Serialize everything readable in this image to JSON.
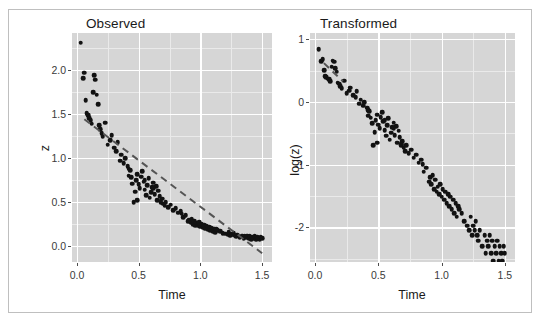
{
  "figure": {
    "width": 541,
    "height": 320,
    "background": "#ffffff",
    "border_color": "#bfbfbf",
    "panel_fill": "#d6d6d6",
    "grid_major_color": "#ffffff",
    "grid_minor_color": "#eaeaea",
    "point_color": "#121212",
    "fitline_color": "#555555"
  },
  "chart_data": [
    {
      "type": "scatter",
      "title": "Observed",
      "xlabel": "Time",
      "ylabel": "z",
      "xlim": [
        -0.04,
        1.58
      ],
      "ylim": [
        -0.18,
        2.42
      ],
      "xticks": [
        0.0,
        0.5,
        1.0,
        1.5
      ],
      "xticklabels": [
        "0.0",
        "0.5",
        "1.0",
        "1.5"
      ],
      "yticks": [
        0.0,
        0.5,
        1.0,
        1.5,
        2.0
      ],
      "yticklabels": [
        "0.0",
        "0.5",
        "1.0",
        "1.5",
        "2.0"
      ],
      "xminor": [
        0.25,
        0.75,
        1.25
      ],
      "yminor": [
        0.25,
        0.75,
        1.25,
        1.75,
        2.25
      ],
      "grid": true,
      "legend": "none",
      "fit_line": {
        "style": "dashed",
        "x": [
          0.06,
          1.5
        ],
        "y": [
          1.44,
          -0.08
        ]
      },
      "x": [
        0.03,
        0.05,
        0.06,
        0.07,
        0.08,
        0.09,
        0.1,
        0.11,
        0.12,
        0.13,
        0.14,
        0.15,
        0.16,
        0.17,
        0.18,
        0.19,
        0.2,
        0.21,
        0.23,
        0.25,
        0.27,
        0.28,
        0.3,
        0.32,
        0.33,
        0.35,
        0.36,
        0.38,
        0.39,
        0.41,
        0.42,
        0.43,
        0.44,
        0.45,
        0.46,
        0.47,
        0.48,
        0.49,
        0.5,
        0.51,
        0.52,
        0.53,
        0.54,
        0.55,
        0.56,
        0.57,
        0.58,
        0.59,
        0.6,
        0.61,
        0.62,
        0.63,
        0.64,
        0.65,
        0.66,
        0.67,
        0.68,
        0.69,
        0.7,
        0.71,
        0.72,
        0.74,
        0.76,
        0.78,
        0.8,
        0.82,
        0.84,
        0.86,
        0.88,
        0.9,
        0.91,
        0.92,
        0.93,
        0.94,
        0.95,
        0.96,
        0.97,
        0.98,
        0.99,
        1.0,
        1.01,
        1.02,
        1.03,
        1.04,
        1.05,
        1.06,
        1.07,
        1.08,
        1.09,
        1.1,
        1.11,
        1.12,
        1.14,
        1.16,
        1.18,
        1.2,
        1.22,
        1.23,
        1.24,
        1.25,
        1.26,
        1.27,
        1.28,
        1.29,
        1.3,
        1.32,
        1.34,
        1.35,
        1.36,
        1.37,
        1.38,
        1.39,
        1.4,
        1.41,
        1.42,
        1.43,
        1.44,
        1.45,
        1.46,
        1.47,
        1.48,
        1.49,
        1.5,
        0.42,
        0.49,
        0.55,
        0.62,
        0.68,
        0.85,
        1.13
      ],
      "y": [
        2.31,
        1.91,
        1.97,
        1.66,
        1.51,
        1.49,
        1.45,
        1.43,
        1.39,
        1.75,
        1.94,
        1.89,
        1.72,
        1.61,
        1.37,
        1.33,
        1.28,
        1.25,
        1.4,
        1.15,
        1.2,
        1.26,
        1.12,
        1.08,
        1.18,
        0.97,
        1.04,
        0.94,
        1.0,
        0.91,
        0.88,
        0.86,
        0.78,
        0.71,
        0.5,
        0.62,
        0.75,
        0.82,
        0.7,
        0.66,
        0.79,
        0.85,
        0.73,
        0.64,
        0.58,
        0.69,
        0.77,
        0.55,
        0.61,
        0.67,
        0.72,
        0.59,
        0.68,
        0.52,
        0.63,
        0.57,
        0.5,
        0.54,
        0.48,
        0.46,
        0.5,
        0.44,
        0.47,
        0.41,
        0.43,
        0.38,
        0.4,
        0.33,
        0.35,
        0.28,
        0.3,
        0.27,
        0.31,
        0.25,
        0.29,
        0.24,
        0.26,
        0.23,
        0.27,
        0.22,
        0.25,
        0.21,
        0.24,
        0.2,
        0.23,
        0.19,
        0.22,
        0.18,
        0.21,
        0.17,
        0.2,
        0.16,
        0.18,
        0.17,
        0.15,
        0.14,
        0.13,
        0.16,
        0.12,
        0.14,
        0.13,
        0.15,
        0.12,
        0.11,
        0.13,
        0.1,
        0.12,
        0.09,
        0.11,
        0.1,
        0.12,
        0.09,
        0.11,
        0.08,
        0.1,
        0.09,
        0.11,
        0.08,
        0.1,
        0.09,
        0.08,
        0.1,
        0.09,
        0.8,
        0.52,
        0.75,
        0.66,
        0.51,
        0.37,
        0.19
      ]
    },
    {
      "type": "scatter",
      "title": "Transformed",
      "xlabel": "Time",
      "ylabel": "log(z)",
      "xlim": [
        -0.04,
        1.58
      ],
      "ylim": [
        -2.55,
        1.1
      ],
      "xticks": [
        0.0,
        0.5,
        1.0,
        1.5
      ],
      "xticklabels": [
        "0.0",
        "0.5",
        "1.0",
        "1.5"
      ],
      "yticks": [
        1,
        0,
        -1,
        -2
      ],
      "yticklabels": [
        "1",
        "0",
        "-1",
        "-2"
      ],
      "xminor": [
        0.25,
        0.75,
        1.25
      ],
      "yminor": [
        0.5,
        -0.5,
        -1.5,
        -2.5
      ],
      "grid": true,
      "legend": "none",
      "fit_line": {
        "style": "dashed",
        "x": [
          0.07,
          0.22
        ],
        "y": [
          0.62,
          0.33
        ]
      },
      "x": [
        0.03,
        0.05,
        0.06,
        0.07,
        0.08,
        0.09,
        0.1,
        0.11,
        0.12,
        0.13,
        0.14,
        0.15,
        0.16,
        0.17,
        0.18,
        0.19,
        0.2,
        0.21,
        0.23,
        0.25,
        0.27,
        0.28,
        0.3,
        0.32,
        0.33,
        0.35,
        0.36,
        0.38,
        0.39,
        0.41,
        0.42,
        0.43,
        0.44,
        0.45,
        0.46,
        0.47,
        0.48,
        0.49,
        0.5,
        0.51,
        0.52,
        0.53,
        0.54,
        0.55,
        0.56,
        0.57,
        0.58,
        0.59,
        0.6,
        0.61,
        0.62,
        0.63,
        0.64,
        0.65,
        0.66,
        0.67,
        0.68,
        0.69,
        0.7,
        0.71,
        0.72,
        0.74,
        0.76,
        0.78,
        0.8,
        0.82,
        0.84,
        0.86,
        0.88,
        0.9,
        0.91,
        0.92,
        0.93,
        0.94,
        0.95,
        0.96,
        0.97,
        0.98,
        0.99,
        1.0,
        1.01,
        1.02,
        1.03,
        1.04,
        1.05,
        1.06,
        1.07,
        1.08,
        1.09,
        1.1,
        1.11,
        1.12,
        1.14,
        1.16,
        1.18,
        1.2,
        1.22,
        1.23,
        1.24,
        1.25,
        1.26,
        1.27,
        1.28,
        1.29,
        1.3,
        1.32,
        1.34,
        1.35,
        1.36,
        1.37,
        1.38,
        1.39,
        1.4,
        1.41,
        1.42,
        1.43,
        1.44,
        1.45,
        1.46,
        1.47,
        1.48,
        1.49,
        1.5,
        0.42,
        0.49,
        0.55,
        0.62,
        0.68,
        0.85,
        1.13
      ],
      "y": [
        0.84,
        0.65,
        0.68,
        0.51,
        0.41,
        0.4,
        0.37,
        0.36,
        0.33,
        0.56,
        0.66,
        0.64,
        0.54,
        0.48,
        0.31,
        0.29,
        0.25,
        0.22,
        0.34,
        0.14,
        0.18,
        0.23,
        0.11,
        0.08,
        0.17,
        -0.03,
        0.04,
        -0.06,
        0.0,
        -0.09,
        -0.13,
        -0.15,
        -0.25,
        -0.34,
        -0.69,
        -0.48,
        -0.29,
        -0.2,
        -0.36,
        -0.42,
        -0.24,
        -0.16,
        -0.31,
        -0.45,
        -0.54,
        -0.37,
        -0.26,
        -0.6,
        -0.49,
        -0.4,
        -0.33,
        -0.53,
        -0.39,
        -0.65,
        -0.46,
        -0.56,
        -0.69,
        -0.62,
        -0.73,
        -0.78,
        -0.69,
        -0.82,
        -0.76,
        -0.89,
        -0.84,
        -0.97,
        -0.92,
        -1.11,
        -1.05,
        -1.27,
        -1.2,
        -1.31,
        -1.17,
        -1.39,
        -1.24,
        -1.43,
        -1.35,
        -1.47,
        -1.31,
        -1.51,
        -1.39,
        -1.56,
        -1.43,
        -1.61,
        -1.47,
        -1.66,
        -1.51,
        -1.71,
        -1.56,
        -1.77,
        -1.61,
        -1.83,
        -1.71,
        -1.77,
        -1.9,
        -1.97,
        -2.04,
        -1.83,
        -2.12,
        -1.97,
        -2.04,
        -1.9,
        -2.12,
        -2.21,
        -2.04,
        -2.3,
        -2.12,
        -2.41,
        -2.21,
        -2.3,
        -2.12,
        -2.41,
        -2.21,
        -2.53,
        -2.3,
        -2.41,
        -2.21,
        -2.53,
        -2.3,
        -2.41,
        -2.53,
        -2.3,
        -2.41,
        -0.22,
        -0.65,
        -0.29,
        -0.42,
        -0.67,
        -0.99,
        -1.66
      ]
    }
  ]
}
